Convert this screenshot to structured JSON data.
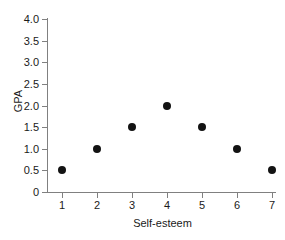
{
  "chart_data": {
    "type": "scatter",
    "title": "",
    "xlabel": "Self-esteem",
    "ylabel": "GPA",
    "x": [
      1,
      2,
      3,
      4,
      5,
      6,
      7
    ],
    "values": [
      0.5,
      1.0,
      1.5,
      2.0,
      1.5,
      1.0,
      0.5
    ],
    "points": [
      {
        "x": 1,
        "y": 0.5
      },
      {
        "x": 2,
        "y": 1.0
      },
      {
        "x": 3,
        "y": 1.5
      },
      {
        "x": 4,
        "y": 2.0
      },
      {
        "x": 5,
        "y": 1.5
      },
      {
        "x": 6,
        "y": 1.0
      },
      {
        "x": 7,
        "y": 0.5
      }
    ],
    "xlim": [
      0.5,
      7.5
    ],
    "ylim": [
      0,
      4.0
    ],
    "xticks": [
      "1",
      "2",
      "3",
      "4",
      "5",
      "6",
      "7"
    ],
    "yticks": [
      "0",
      "0.5",
      "1.0",
      "1.5",
      "2.0",
      "2.5",
      "3.0",
      "3.5",
      "4.0"
    ],
    "ytick_values": [
      0,
      0.5,
      1.0,
      1.5,
      2.0,
      2.5,
      3.0,
      3.5,
      4.0
    ],
    "grid": false,
    "legend": null,
    "marker_color": "#131313",
    "axis_color": "#808080"
  }
}
